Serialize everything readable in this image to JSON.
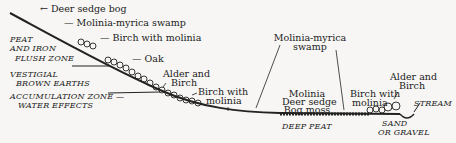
{
  "diagram": {
    "type": "hillslope vegetation cross-section",
    "labels": {
      "deer_sedge_bog": "← Deer sedge bog",
      "molinia_myrica_swamp_top": "— Molinia-myrica swamp",
      "birch_with_molinia_top": "— Birch with molinia",
      "oak": "— Oak",
      "alder_birch_left_1": "Alder and",
      "alder_birch_left_2": "Birch",
      "birch_with_molinia_mid_1": "Birch with",
      "birch_with_molinia_mid_2": "molinia",
      "molinia_myrica_swamp_right_1": "Molinia-myrica",
      "molinia_myrica_swamp_right_2": "swamp",
      "bog_1": "Molinia",
      "bog_2": "Deer sedge",
      "bog_3": "Bog moss",
      "birch_with_molinia_right_1": "Birch with",
      "birch_with_molinia_right_2": "molinia",
      "alder_birch_right_1": "Alder and",
      "alder_birch_right_2": "Birch",
      "stream": "STREAM",
      "sand_1": "SAND",
      "sand_2": "OR GRAVEL",
      "deep_peat": "DEEP PEAT"
    },
    "zones": {
      "peat_iron_1": "PEAT",
      "peat_iron_2": "AND IRON",
      "peat_iron_3": "FLUSH ZONE",
      "vestigial_1": "VESTIGIAL",
      "vestigial_2": "BROWN EARTHS",
      "accumulation_1": "ACCUMULATION ZONE —",
      "accumulation_2": "WATER EFFECTS"
    }
  }
}
